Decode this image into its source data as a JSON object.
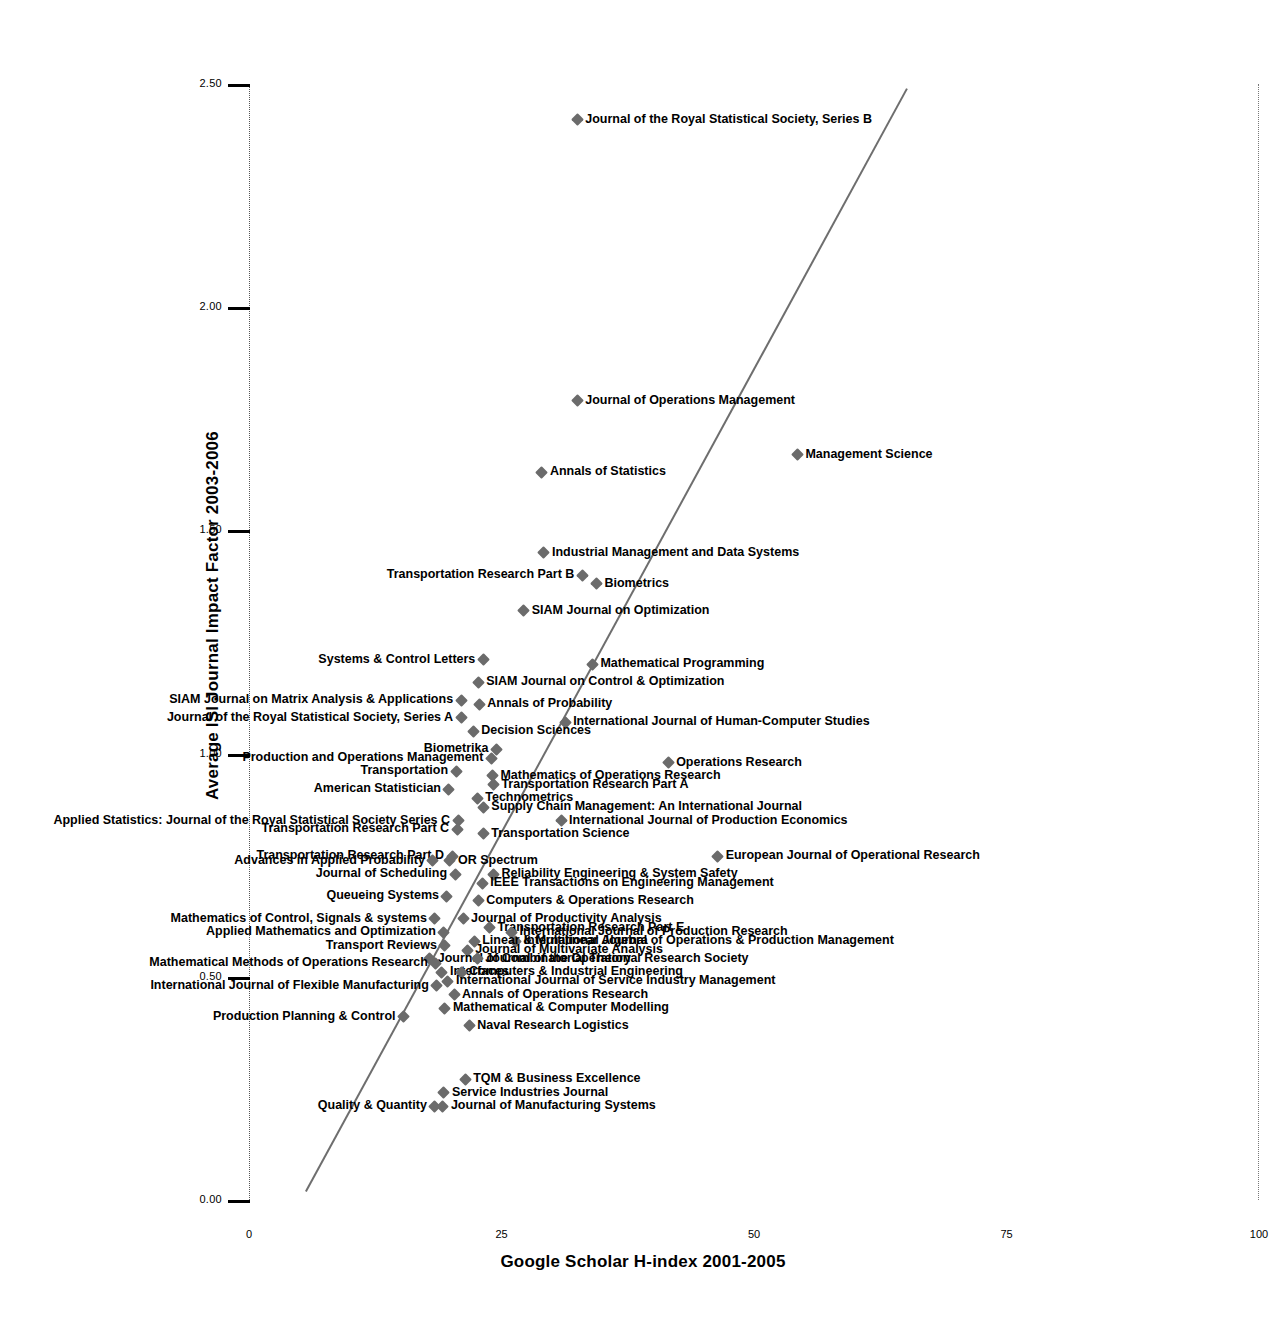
{
  "chart_data": {
    "type": "scatter",
    "title": "",
    "xlabel": "Google Scholar H-index 2001-2005",
    "ylabel": "Average ISI Journal Impact Factor 2003-2006",
    "xlim": [
      0,
      100
    ],
    "ylim": [
      0.0,
      2.5
    ],
    "xticks": [
      "0",
      "25",
      "50",
      "75",
      "100"
    ],
    "yticks": [
      "0.00",
      "0.50",
      "1.00",
      "1.50",
      "2.00",
      "2.50"
    ],
    "grid": false,
    "legend": "none",
    "trendline": {
      "present": true,
      "x0": 5.5,
      "y0": 0.02,
      "x1": 65.0,
      "y1": 2.49
    },
    "points": [
      {
        "label": "Journal of the Royal Statistical Society, Series B",
        "x": 32.5,
        "y": 2.42,
        "side": "right"
      },
      {
        "label": "Journal of Operations Management",
        "x": 32.5,
        "y": 1.79,
        "side": "right"
      },
      {
        "label": "Management Science",
        "x": 54.3,
        "y": 1.67,
        "side": "right"
      },
      {
        "label": "Annals of Statistics",
        "x": 29.0,
        "y": 1.63,
        "side": "right"
      },
      {
        "label": "Industrial Management and Data Systems",
        "x": 29.2,
        "y": 1.45,
        "side": "right"
      },
      {
        "label": "Transportation Research Part B",
        "x": 33.0,
        "y": 1.4,
        "side": "left"
      },
      {
        "label": "Biometrics",
        "x": 34.4,
        "y": 1.38,
        "side": "right"
      },
      {
        "label": "SIAM Journal on Optimization",
        "x": 27.2,
        "y": 1.32,
        "side": "right"
      },
      {
        "label": "Systems & Control Letters",
        "x": 23.2,
        "y": 1.21,
        "side": "left"
      },
      {
        "label": "Mathematical Programming",
        "x": 34.0,
        "y": 1.2,
        "side": "right"
      },
      {
        "label": "SIAM Journal on Control & Optimization",
        "x": 22.7,
        "y": 1.16,
        "side": "right"
      },
      {
        "label": "SIAM Journal on Matrix Analysis & Applications",
        "x": 21.0,
        "y": 1.12,
        "side": "left"
      },
      {
        "label": "Annals of Probability",
        "x": 22.8,
        "y": 1.11,
        "side": "right"
      },
      {
        "label": "Journal of the Royal Statistical Society, Series A",
        "x": 21.0,
        "y": 1.08,
        "side": "left"
      },
      {
        "label": "International Journal of Human-Computer Studies",
        "x": 31.3,
        "y": 1.07,
        "side": "right"
      },
      {
        "label": "Decision Sciences",
        "x": 22.2,
        "y": 1.05,
        "side": "right"
      },
      {
        "label": "Biometrika",
        "x": 24.5,
        "y": 1.01,
        "side": "left"
      },
      {
        "label": "Production and Operations Management",
        "x": 24.0,
        "y": 0.99,
        "side": "left"
      },
      {
        "label": "Operations Research",
        "x": 41.5,
        "y": 0.98,
        "side": "right"
      },
      {
        "label": "Transportation",
        "x": 20.5,
        "y": 0.96,
        "side": "left"
      },
      {
        "label": "Mathematics of Operations Research",
        "x": 24.1,
        "y": 0.95,
        "side": "right"
      },
      {
        "label": "Transportation Research Part A",
        "x": 24.2,
        "y": 0.93,
        "side": "right"
      },
      {
        "label": "American Statistician",
        "x": 19.8,
        "y": 0.92,
        "side": "left"
      },
      {
        "label": "Technometrics",
        "x": 22.6,
        "y": 0.9,
        "side": "right"
      },
      {
        "label": "Supply Chain Management: An International Journal",
        "x": 23.2,
        "y": 0.88,
        "side": "right"
      },
      {
        "label": "Applied Statistics: Journal of the Royal Statistical Society Series C",
        "x": 20.7,
        "y": 0.85,
        "side": "left"
      },
      {
        "label": "International Journal of Production Economics",
        "x": 30.9,
        "y": 0.85,
        "side": "right"
      },
      {
        "label": "Transportation Research Part C",
        "x": 20.6,
        "y": 0.83,
        "side": "left"
      },
      {
        "label": "Transportation Science",
        "x": 23.2,
        "y": 0.82,
        "side": "right"
      },
      {
        "label": "Transportation Research Part D",
        "x": 20.1,
        "y": 0.77,
        "side": "left"
      },
      {
        "label": "European Journal of Operational Research",
        "x": 46.4,
        "y": 0.77,
        "side": "right"
      },
      {
        "label": "Advances in Applied Probability",
        "x": 18.2,
        "y": 0.76,
        "side": "left"
      },
      {
        "label": "OR Spectrum",
        "x": 19.9,
        "y": 0.76,
        "side": "right"
      },
      {
        "label": "Journal of Scheduling",
        "x": 20.4,
        "y": 0.73,
        "side": "left"
      },
      {
        "label": "Reliability Engineering & System Safety",
        "x": 24.2,
        "y": 0.73,
        "side": "right"
      },
      {
        "label": "IEEE Transactions on Engineering Management",
        "x": 23.1,
        "y": 0.71,
        "side": "right"
      },
      {
        "label": "Queueing Systems",
        "x": 19.6,
        "y": 0.68,
        "side": "left"
      },
      {
        "label": "Computers & Operations Research",
        "x": 22.7,
        "y": 0.67,
        "side": "right"
      },
      {
        "label": "Mathematics of Control, Signals & systems",
        "x": 18.4,
        "y": 0.63,
        "side": "left"
      },
      {
        "label": "Journal of Productivity Analysis",
        "x": 21.2,
        "y": 0.63,
        "side": "right"
      },
      {
        "label": "Transportation Research Part E",
        "x": 23.8,
        "y": 0.61,
        "side": "right"
      },
      {
        "label": "International Journal of Production Research",
        "x": 26.0,
        "y": 0.6,
        "side": "right"
      },
      {
        "label": "Applied Mathematics and Optimization",
        "x": 19.3,
        "y": 0.6,
        "side": "left"
      },
      {
        "label": "International Journal of Operations & Production Management",
        "x": 26.4,
        "y": 0.58,
        "side": "right"
      },
      {
        "label": "Linear & Multilinear Algebra",
        "x": 22.3,
        "y": 0.58,
        "side": "right"
      },
      {
        "label": "Transport Reviews",
        "x": 19.4,
        "y": 0.57,
        "side": "left"
      },
      {
        "label": "Journal of Multivariate Analysis",
        "x": 21.6,
        "y": 0.56,
        "side": "right"
      },
      {
        "label": "Journal of Combinatorial Theory",
        "x": 17.9,
        "y": 0.54,
        "side": "right"
      },
      {
        "label": "Journal of the Operational Research Society",
        "x": 22.6,
        "y": 0.54,
        "side": "right"
      },
      {
        "label": "Mathematical Methods of Operations Research",
        "x": 18.5,
        "y": 0.53,
        "side": "left"
      },
      {
        "label": "Interfaces",
        "x": 19.1,
        "y": 0.51,
        "side": "right"
      },
      {
        "label": "Computers & Industrial Engineering",
        "x": 21.0,
        "y": 0.51,
        "side": "right"
      },
      {
        "label": "International Journal of Service Industry Management",
        "x": 19.7,
        "y": 0.49,
        "side": "right"
      },
      {
        "label": "International Journal of Flexible Manufacturing",
        "x": 18.6,
        "y": 0.48,
        "side": "left"
      },
      {
        "label": "Annals of Operations Research",
        "x": 20.3,
        "y": 0.46,
        "side": "right"
      },
      {
        "label": "Mathematical & Computer Modelling",
        "x": 19.4,
        "y": 0.43,
        "side": "right"
      },
      {
        "label": "Production Planning & Control",
        "x": 15.3,
        "y": 0.41,
        "side": "left"
      },
      {
        "label": "Naval Research Logistics",
        "x": 21.8,
        "y": 0.39,
        "side": "right"
      },
      {
        "label": "TQM & Business Excellence",
        "x": 21.4,
        "y": 0.27,
        "side": "right"
      },
      {
        "label": "Service Industries Journal",
        "x": 19.3,
        "y": 0.24,
        "side": "right"
      },
      {
        "label": "Quality & Quantity",
        "x": 18.4,
        "y": 0.21,
        "side": "left"
      },
      {
        "label": "Journal of Manufacturing Systems",
        "x": 19.2,
        "y": 0.21,
        "side": "right"
      }
    ]
  }
}
